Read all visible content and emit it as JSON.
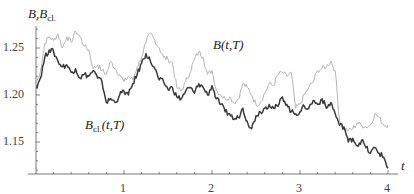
{
  "chart_data": {
    "type": "line",
    "title": "",
    "xlabel": "t",
    "ylabel": "B, B_cl.",
    "xlim": [
      0,
      4.1
    ],
    "ylim": [
      1.116,
      1.285
    ],
    "grid": false,
    "legend_position": "inline labels",
    "x_ticks": [
      1,
      2,
      3,
      4
    ],
    "x_tick_labels": [
      "1",
      "2",
      "3",
      "4"
    ],
    "y_ticks": [
      1.15,
      1.2,
      1.25
    ],
    "y_tick_labels": [
      "1.15",
      "1.20",
      "1.25"
    ],
    "series": [
      {
        "name": "B(t,T)",
        "color": "#b4b4b4",
        "x": [
          0.0,
          0.05,
          0.1,
          0.15,
          0.2,
          0.25,
          0.3,
          0.35,
          0.4,
          0.45,
          0.5,
          0.55,
          0.6,
          0.65,
          0.7,
          0.75,
          0.8,
          0.85,
          0.9,
          0.95,
          1.0,
          1.05,
          1.1,
          1.15,
          1.2,
          1.25,
          1.3,
          1.35,
          1.4,
          1.45,
          1.5,
          1.55,
          1.6,
          1.65,
          1.7,
          1.75,
          1.8,
          1.85,
          1.9,
          1.95,
          2.0,
          2.05,
          2.1,
          2.15,
          2.2,
          2.25,
          2.3,
          2.35,
          2.4,
          2.45,
          2.5,
          2.55,
          2.6,
          2.65,
          2.7,
          2.75,
          2.8,
          2.85,
          2.9,
          2.95,
          3.0,
          3.05,
          3.1,
          3.15,
          3.2,
          3.25,
          3.3,
          3.35,
          3.4,
          3.45,
          3.5,
          3.55,
          3.6,
          3.65,
          3.7,
          3.75,
          3.8,
          3.85,
          3.9,
          3.95,
          4.0
        ],
        "values": [
          1.212,
          1.225,
          1.255,
          1.262,
          1.258,
          1.265,
          1.25,
          1.262,
          1.256,
          1.268,
          1.262,
          1.252,
          1.248,
          1.228,
          1.232,
          1.226,
          1.222,
          1.236,
          1.228,
          1.222,
          1.214,
          1.22,
          1.216,
          1.23,
          1.24,
          1.256,
          1.266,
          1.258,
          1.25,
          1.24,
          1.238,
          1.234,
          1.208,
          1.204,
          1.214,
          1.224,
          1.238,
          1.246,
          1.24,
          1.222,
          1.226,
          1.205,
          1.2,
          1.196,
          1.198,
          1.192,
          1.196,
          1.212,
          1.208,
          1.2,
          1.19,
          1.192,
          1.202,
          1.212,
          1.21,
          1.222,
          1.224,
          1.22,
          1.224,
          1.186,
          1.19,
          1.2,
          1.208,
          1.214,
          1.226,
          1.228,
          1.23,
          1.236,
          1.226,
          1.172,
          1.165,
          1.162,
          1.164,
          1.17,
          1.168,
          1.166,
          1.168,
          1.18,
          1.176,
          1.168,
          1.168
        ]
      },
      {
        "name": "B_cl.(t,T)",
        "color": "#3a3a3a",
        "x": [
          0.0,
          0.05,
          0.1,
          0.15,
          0.2,
          0.25,
          0.3,
          0.35,
          0.4,
          0.45,
          0.5,
          0.55,
          0.6,
          0.65,
          0.7,
          0.75,
          0.8,
          0.85,
          0.9,
          0.95,
          1.0,
          1.05,
          1.1,
          1.15,
          1.2,
          1.25,
          1.3,
          1.35,
          1.4,
          1.45,
          1.5,
          1.55,
          1.6,
          1.65,
          1.7,
          1.75,
          1.8,
          1.85,
          1.9,
          1.95,
          2.0,
          2.05,
          2.1,
          2.15,
          2.2,
          2.25,
          2.3,
          2.35,
          2.4,
          2.45,
          2.5,
          2.55,
          2.6,
          2.65,
          2.7,
          2.75,
          2.8,
          2.85,
          2.9,
          2.95,
          3.0,
          3.05,
          3.1,
          3.15,
          3.2,
          3.25,
          3.3,
          3.35,
          3.4,
          3.45,
          3.5,
          3.55,
          3.6,
          3.65,
          3.7,
          3.75,
          3.8,
          3.85,
          3.9,
          3.95,
          4.0
        ],
        "values": [
          1.208,
          1.218,
          1.24,
          1.248,
          1.246,
          1.236,
          1.23,
          1.232,
          1.224,
          1.228,
          1.218,
          1.222,
          1.22,
          1.226,
          1.218,
          1.214,
          1.192,
          1.196,
          1.192,
          1.2,
          1.204,
          1.2,
          1.212,
          1.222,
          1.234,
          1.244,
          1.236,
          1.228,
          1.216,
          1.214,
          1.206,
          1.208,
          1.198,
          1.196,
          1.204,
          1.208,
          1.202,
          1.212,
          1.208,
          1.2,
          1.21,
          1.196,
          1.19,
          1.182,
          1.18,
          1.174,
          1.176,
          1.186,
          1.172,
          1.164,
          1.178,
          1.182,
          1.186,
          1.19,
          1.186,
          1.188,
          1.198,
          1.19,
          1.182,
          1.18,
          1.182,
          1.188,
          1.186,
          1.194,
          1.19,
          1.196,
          1.186,
          1.192,
          1.18,
          1.168,
          1.166,
          1.15,
          1.154,
          1.146,
          1.152,
          1.144,
          1.138,
          1.144,
          1.138,
          1.134,
          1.122
        ]
      }
    ],
    "annotations": [
      {
        "text": "B(t,T)",
        "x": 2.0,
        "y": 1.263
      },
      {
        "text": "B_cl.(t,T)",
        "x": 0.55,
        "y": 1.183
      }
    ]
  },
  "labels": {
    "y_axis_main": "B,B",
    "y_axis_sub": "cl.",
    "x_axis": "t",
    "series_b_main": "B(t,T)",
    "series_bcl_main": "B",
    "series_bcl_sub": "cl.",
    "series_bcl_tail": "(t,T)"
  }
}
